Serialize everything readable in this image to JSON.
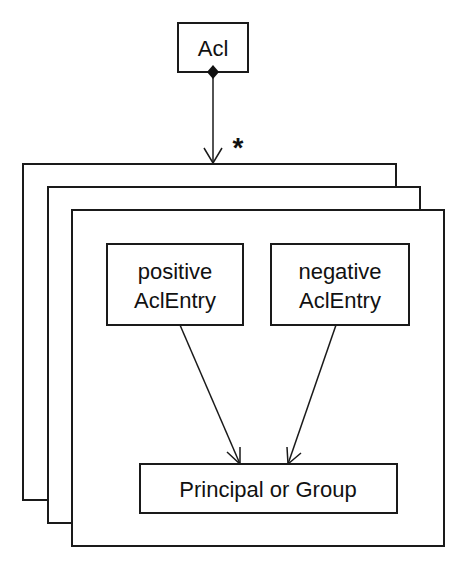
{
  "diagram": {
    "type": "uml-class-diagram",
    "acl": {
      "label": "Acl"
    },
    "multiplicity": "*",
    "stack_frames": 3,
    "positive_entry": {
      "line1": "positive",
      "line2": "AclEntry"
    },
    "negative_entry": {
      "line1": "negative",
      "line2": "AclEntry"
    },
    "principal": {
      "label": "Principal or Group"
    },
    "relations": [
      {
        "from": "Acl",
        "to": "AclEntry stack",
        "kind": "composition",
        "multiplicity": "*"
      },
      {
        "from": "positive AclEntry",
        "to": "Principal or Group",
        "kind": "association"
      },
      {
        "from": "negative AclEntry",
        "to": "Principal or Group",
        "kind": "association"
      }
    ],
    "colors": {
      "stroke": "#1a1a1a",
      "background": "#ffffff"
    }
  }
}
